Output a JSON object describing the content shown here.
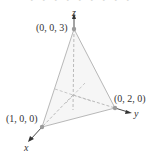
{
  "figure": {
    "top_cut_text": "• • • • • • • • •",
    "axes": {
      "x": "x",
      "y": "y",
      "z": "z"
    },
    "points": [
      {
        "label": "(0, 0, 3)"
      },
      {
        "label": "(0, 2, 0)"
      },
      {
        "label": "(1, 0, 0)"
      }
    ],
    "colors": {
      "edge": "#b0b0b0",
      "axis": "#333333",
      "point": "#9a9a9a",
      "face_shade": "#ececec"
    }
  }
}
